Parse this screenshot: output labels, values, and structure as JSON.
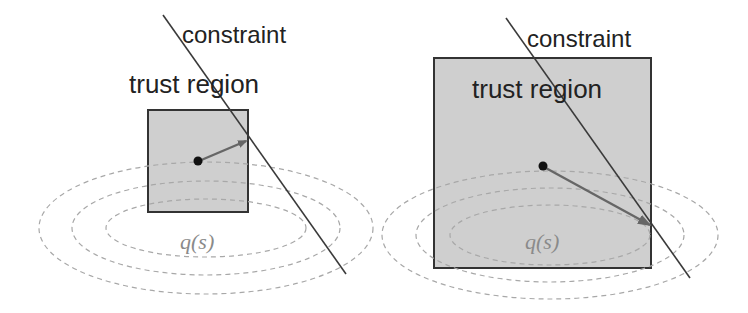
{
  "panels": [
    {
      "id": "small-trust-region",
      "constraint_label": "constraint",
      "region_label": "trust region",
      "model_label": "q(s)"
    },
    {
      "id": "large-trust-region",
      "constraint_label": "constraint",
      "region_label": "trust region",
      "model_label": "q(s)"
    }
  ],
  "colors": {
    "region_fill": "#cfcfcf",
    "region_stroke": "#333333",
    "constraint_line": "#3a3a3a",
    "arrow": "#666666",
    "contour": "#a8a8a8",
    "point": "#111111"
  }
}
